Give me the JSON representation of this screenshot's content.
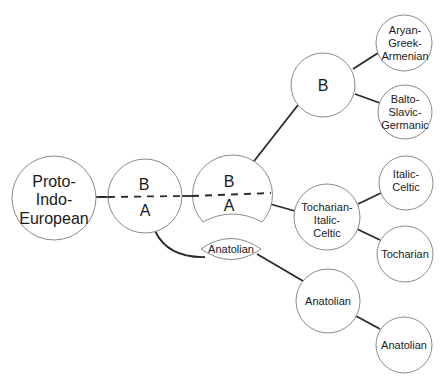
{
  "diagram": {
    "title": "",
    "nodes": {
      "pie": {
        "lines": [
          "Proto-",
          "Indo-",
          "European"
        ]
      },
      "split1": {
        "top": "B",
        "bottom": "A"
      },
      "split2": {
        "top": "B",
        "bottom": "A"
      },
      "anatolian_lens": {
        "label": "Anatolian"
      },
      "b_node": {
        "label": "B"
      },
      "aryan": {
        "lines": [
          "Aryan-",
          "Greek-",
          "Armenian"
        ]
      },
      "balto": {
        "lines": [
          "Balto-",
          "Slavic-",
          "Germanic"
        ]
      },
      "toch_ital": {
        "lines": [
          "Tocharian-",
          "Italic-",
          "Celtic"
        ]
      },
      "italic": {
        "lines": [
          "Italic-",
          "Celtic"
        ]
      },
      "tocharian": {
        "label": "Tocharian"
      },
      "anatolian_mid": {
        "label": "Anatolian"
      },
      "anatolian_end": {
        "label": "Anatolian"
      }
    },
    "edges": [
      [
        "pie",
        "split1"
      ],
      [
        "split1",
        "split2"
      ],
      [
        "split1",
        "anatolian_lens"
      ],
      [
        "split2",
        "b_node"
      ],
      [
        "split2",
        "toch_ital"
      ],
      [
        "anatolian_lens",
        "anatolian_mid"
      ],
      [
        "b_node",
        "aryan"
      ],
      [
        "b_node",
        "balto"
      ],
      [
        "toch_ital",
        "italic"
      ],
      [
        "toch_ital",
        "tocharian"
      ],
      [
        "anatolian_mid",
        "anatolian_end"
      ]
    ],
    "colors": {
      "node_stroke": "#8a8a8a",
      "edge": "#2a2a2a",
      "text": "#1a1a1a",
      "background": "#ffffff"
    }
  }
}
